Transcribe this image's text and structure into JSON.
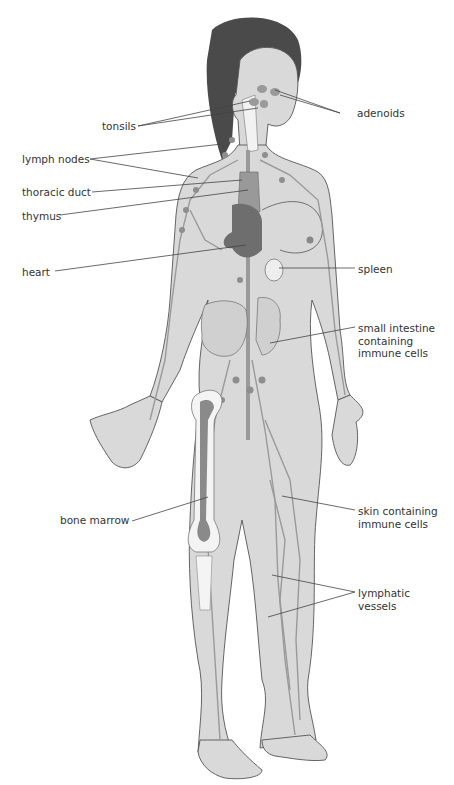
{
  "diagram": {
    "type": "anatomical illustration",
    "colors": {
      "skin": "#d9d9d9",
      "outline": "#555555",
      "hair": "#4a4a4a",
      "lymph": "#9a9a9a",
      "organ_dark": "#6e6e6e",
      "bone": "#f4f4f4",
      "marrow": "#8a8a8a",
      "leader_line": "#444444"
    },
    "labels": {
      "tonsils": "tonsils",
      "adenoids": "adenoids",
      "lymph_nodes": "lymph nodes",
      "thoracic_duct": "thoracic duct",
      "thymus": "thymus",
      "heart": "heart",
      "spleen": "spleen",
      "small_intestine_1": "small intestine",
      "small_intestine_2": "containing",
      "small_intestine_3": "immune cells",
      "bone_marrow": "bone marrow",
      "skin_1": "skin containing",
      "skin_2": "immune cells",
      "lymphatic_1": "lymphatic",
      "lymphatic_2": "vessels"
    }
  }
}
